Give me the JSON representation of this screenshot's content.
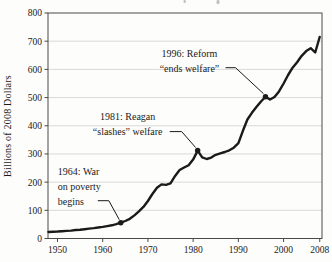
{
  "chart_data": {
    "type": "line",
    "ylabel": "Billions of 2008 Dollars",
    "xlim": [
      1947.9,
      2008.5
    ],
    "ylim": [
      0,
      800
    ],
    "x_ticks": [
      1950,
      1960,
      1970,
      1980,
      1990,
      2000,
      2008
    ],
    "y_ticks": [
      0,
      100,
      200,
      300,
      400,
      500,
      600,
      700,
      800
    ],
    "grid": "horizontal-light",
    "legend": "none",
    "line_color": "#1a1a1a",
    "grid_color": "#d9d9d9",
    "axis_color": "#4a4a4a",
    "series": [
      {
        "name": "welfare-spending",
        "x": [
          1948,
          1949,
          1950,
          1951,
          1952,
          1953,
          1954,
          1955,
          1956,
          1957,
          1958,
          1959,
          1960,
          1961,
          1962,
          1963,
          1964,
          1965,
          1966,
          1967,
          1968,
          1969,
          1970,
          1971,
          1972,
          1973,
          1974,
          1975,
          1976,
          1977,
          1978,
          1979,
          1980,
          1981,
          1982,
          1983,
          1984,
          1985,
          1986,
          1987,
          1988,
          1989,
          1990,
          1991,
          1992,
          1993,
          1994,
          1995,
          1996,
          1997,
          1998,
          1999,
          2000,
          2001,
          2002,
          2003,
          2004,
          2005,
          2006,
          2007,
          2008
        ],
        "y": [
          23,
          24,
          25,
          26,
          27,
          28,
          30,
          31,
          33,
          35,
          37,
          39,
          41,
          44,
          47,
          51,
          56,
          62,
          70,
          82,
          96,
          112,
          133,
          158,
          180,
          192,
          190,
          196,
          222,
          243,
          252,
          260,
          280,
          312,
          288,
          282,
          287,
          297,
          302,
          307,
          313,
          322,
          338,
          382,
          422,
          446,
          466,
          486,
          503,
          493,
          502,
          522,
          550,
          580,
          606,
          625,
          648,
          665,
          675,
          660,
          715
        ]
      }
    ],
    "annotations": [
      {
        "year": 1964,
        "value": 56,
        "label_lines": [
          "1964: War",
          "on poverty",
          "begins"
        ]
      },
      {
        "year": 1981,
        "value": 312,
        "label_lines": [
          "1981: Reagan",
          "“slashes” welfare"
        ]
      },
      {
        "year": 1996,
        "value": 503,
        "label_lines": [
          "1996: Reform",
          "“ends welfare”"
        ]
      }
    ]
  }
}
